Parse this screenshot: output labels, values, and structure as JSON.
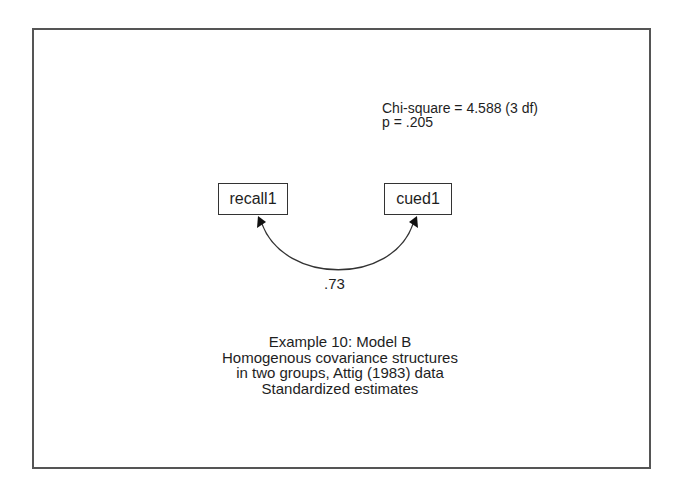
{
  "diagram": {
    "type": "path-diagram",
    "fit": {
      "chi_square_line": "Chi-square = 4.588 (3 df)",
      "p_line": "p = .205",
      "chi_square": 4.588,
      "df": 3,
      "p": 0.205
    },
    "variables": [
      {
        "id": "recall1",
        "label": "recall1",
        "shape": "rectangle"
      },
      {
        "id": "cued1",
        "label": "cued1",
        "shape": "rectangle"
      }
    ],
    "paths": [
      {
        "from": "recall1",
        "to": "cued1",
        "type": "covariance",
        "direction": "bidirectional",
        "estimate": ".73"
      }
    ],
    "caption": {
      "lines": [
        "Example 10:  Model B",
        "Homogenous covariance structures",
        "in two groups, Attig (1983) data",
        "Standardized estimates"
      ]
    },
    "colors": {
      "frame": "#555555",
      "line": "#333333",
      "text": "#1e1e1e",
      "background": "#ffffff"
    }
  }
}
